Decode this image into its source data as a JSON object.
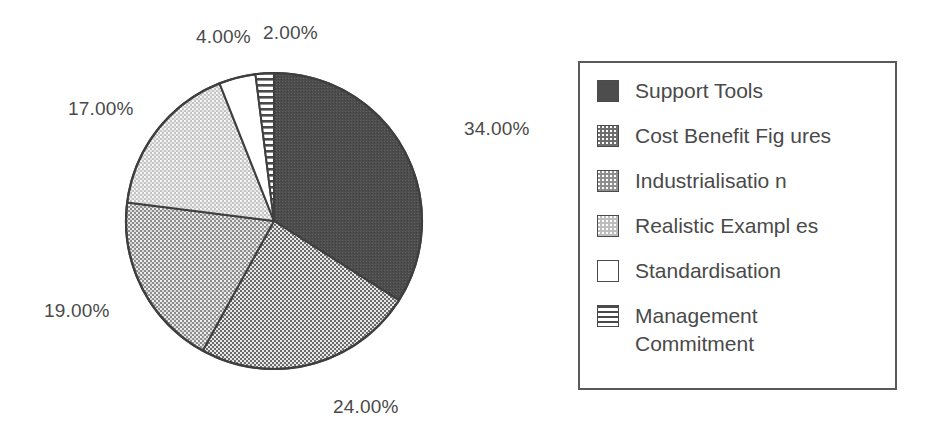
{
  "chart_data": {
    "type": "pie",
    "title": "",
    "subtitle": "",
    "xlabel": "",
    "ylabel": "",
    "categories": [
      "Support Tools",
      "Cost Benefit Fig ures",
      "Industrialisatio n",
      "Realistic Exampl es",
      "Standardisation",
      "Management\nCommitment"
    ],
    "values": [
      34,
      24,
      19,
      17,
      4,
      2
    ],
    "value_labels": [
      "34.00%",
      "24.00%",
      "19.00%",
      "17.00%",
      "4.00%",
      "2.00%"
    ],
    "units": "percent",
    "total": 100,
    "start_angle_deg": 0,
    "direction": "clockwise",
    "legend_position": "right",
    "legend_border": true,
    "grid": false,
    "slice_fills": [
      "solid-dark-grey",
      "dense-dot-dark-grey",
      "dot-mid-grey",
      "dot-light-grey",
      "white",
      "horizontal-stripes"
    ],
    "slice_colors": [
      "#4d4d4d",
      "#6e6e6e",
      "#8f8f8f",
      "#bdbdbd",
      "#ffffff",
      "#ffffff"
    ],
    "outline_color": "#4a4a4a",
    "background_color": "#ffffff",
    "text_color": "#4a4a4a"
  },
  "pie": {
    "labels": [
      {
        "text": "4.00%",
        "name": "pct-label-standardisation",
        "left": 196,
        "top": 26
      },
      {
        "text": "2.00%",
        "name": "pct-label-management-commitment",
        "left": 263,
        "top": 22
      },
      {
        "text": "17.00%",
        "name": "pct-label-realistic-examples",
        "left": 68,
        "top": 98
      },
      {
        "text": "34.00%",
        "name": "pct-label-support-tools",
        "left": 464,
        "top": 118
      },
      {
        "text": "19.00%",
        "name": "pct-label-industrialisation",
        "left": 44,
        "top": 300
      },
      {
        "text": "24.00%",
        "name": "pct-label-cost-benefit-figures",
        "left": 333,
        "top": 396
      }
    ]
  },
  "legend": {
    "items": [
      {
        "label": "Support Tools",
        "swatch": "solid-dark-swatch-icon",
        "fill_class": "sw-solid-dark"
      },
      {
        "label": "Cost Benefit Fig ures",
        "swatch": "dense-dot-swatch-icon",
        "fill_class": "sw-dot-dark"
      },
      {
        "label": "Industrialisatio n",
        "swatch": "mid-dot-swatch-icon",
        "fill_class": "sw-dot-mid"
      },
      {
        "label": "Realistic Exampl es",
        "swatch": "light-dot-swatch-icon",
        "fill_class": "sw-dot-light"
      },
      {
        "label": "Standardisation",
        "swatch": "white-swatch-icon",
        "fill_class": "sw-white"
      },
      {
        "label": "Management\nCommitment",
        "swatch": "striped-swatch-icon",
        "fill_class": "sw-stripe"
      }
    ]
  }
}
